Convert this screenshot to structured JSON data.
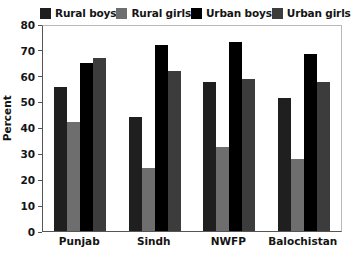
{
  "chart_data": {
    "type": "bar",
    "title": "",
    "subtitle": "",
    "xlabel": "",
    "ylabel": "Percent",
    "categories": [
      "Punjab",
      "Sindh",
      "NWFP",
      "Balochistan"
    ],
    "series": [
      {
        "name": "Rural boys",
        "color": "#201f1f",
        "values": [
          55.5,
          44.0,
          57.5,
          51.5
        ]
      },
      {
        "name": "Rural girls",
        "color": "#6e6e6e",
        "values": [
          42.0,
          24.5,
          32.5,
          28.0
        ]
      },
      {
        "name": "Urban boys",
        "color": "#000000",
        "values": [
          65.0,
          72.0,
          73.0,
          68.3
        ]
      },
      {
        "name": "Urban girls",
        "color": "#3c3c3c",
        "values": [
          66.8,
          62.0,
          58.8,
          57.7
        ]
      }
    ],
    "ylim": [
      0,
      80
    ],
    "yticks": [
      0,
      10,
      20,
      30,
      40,
      50,
      60,
      70,
      80
    ],
    "ytick_labels": [
      "0",
      "10",
      "20",
      "30",
      "40",
      "50",
      "60",
      "70",
      "80"
    ],
    "grid": false,
    "legend_position": "top",
    "frame_color": "#b9b9b9",
    "axis_color": "#555555",
    "background": "#ffffff"
  }
}
